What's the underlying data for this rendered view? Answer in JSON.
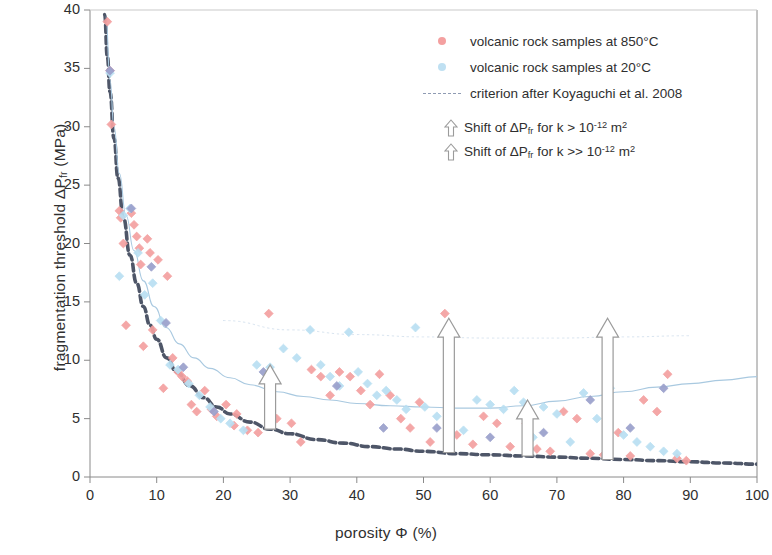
{
  "chart_data": {
    "type": "scatter",
    "title": "",
    "xlabel": "porosity Φ (%)",
    "ylabel": "fragmentation threshold ΔPfr  (MPa)",
    "xlim": [
      0,
      100
    ],
    "ylim": [
      0,
      40
    ],
    "xticks": [
      0,
      10,
      20,
      30,
      40,
      50,
      60,
      70,
      80,
      90,
      100
    ],
    "yticks": [
      0,
      5,
      10,
      15,
      20,
      25,
      30,
      35,
      40
    ],
    "grid": false,
    "legend_position": "top-right",
    "series": [
      {
        "name": "volcanic rock samples at 850°C",
        "type": "scatter",
        "color": "#f4a0a0",
        "marker": "diamond",
        "points": [
          [
            2.6,
            39.0
          ],
          [
            3.0,
            34.8
          ],
          [
            3.2,
            30.2
          ],
          [
            4.4,
            22.8
          ],
          [
            4.6,
            22.2
          ],
          [
            5.0,
            20.0
          ],
          [
            5.4,
            13.0
          ],
          [
            6.2,
            22.6
          ],
          [
            6.6,
            21.6
          ],
          [
            7.0,
            20.6
          ],
          [
            7.4,
            19.6
          ],
          [
            7.6,
            18.2
          ],
          [
            8.0,
            11.2
          ],
          [
            8.6,
            20.4
          ],
          [
            9.0,
            19.2
          ],
          [
            9.4,
            12.6
          ],
          [
            10.2,
            18.6
          ],
          [
            11.0,
            7.6
          ],
          [
            11.6,
            17.2
          ],
          [
            12.4,
            10.2
          ],
          [
            13.2,
            9.0
          ],
          [
            13.8,
            8.6
          ],
          [
            14.6,
            8.2
          ],
          [
            15.2,
            6.2
          ],
          [
            16.0,
            5.6
          ],
          [
            17.2,
            7.4
          ],
          [
            18.2,
            5.8
          ],
          [
            19.0,
            5.2
          ],
          [
            20.4,
            6.2
          ],
          [
            21.6,
            4.4
          ],
          [
            22.0,
            5.4
          ],
          [
            23.6,
            4.0
          ],
          [
            25.2,
            3.8
          ],
          [
            26.8,
            14.0
          ],
          [
            28.0,
            5.0
          ],
          [
            30.2,
            4.6
          ],
          [
            31.6,
            3.0
          ],
          [
            33.2,
            9.2
          ],
          [
            34.6,
            8.6
          ],
          [
            36.0,
            7.0
          ],
          [
            37.4,
            9.0
          ],
          [
            39.0,
            8.6
          ],
          [
            40.6,
            7.4
          ],
          [
            42.0,
            6.2
          ],
          [
            43.4,
            8.8
          ],
          [
            45.0,
            7.0
          ],
          [
            46.6,
            5.0
          ],
          [
            48.0,
            4.2
          ],
          [
            49.4,
            6.4
          ],
          [
            51.0,
            3.0
          ],
          [
            53.2,
            14.0
          ],
          [
            55.0,
            3.6
          ],
          [
            57.4,
            2.8
          ],
          [
            59.0,
            5.2
          ],
          [
            61.0,
            4.6
          ],
          [
            63.0,
            2.6
          ],
          [
            65.4,
            4.6
          ],
          [
            67.0,
            2.4
          ],
          [
            69.0,
            2.2
          ],
          [
            71.0,
            5.6
          ],
          [
            73.0,
            5.0
          ],
          [
            75.0,
            2.0
          ],
          [
            77.0,
            1.9
          ],
          [
            79.2,
            3.8
          ],
          [
            81.0,
            1.8
          ],
          [
            83.0,
            6.6
          ],
          [
            85.0,
            5.6
          ],
          [
            86.6,
            8.8
          ],
          [
            88.0,
            1.6
          ],
          [
            89.4,
            1.4
          ]
        ]
      },
      {
        "name": "volcanic rock samples at 20°C",
        "type": "scatter",
        "color": "#b9dff2",
        "marker": "diamond",
        "points": [
          [
            3.0,
            34.6
          ],
          [
            4.4,
            17.2
          ],
          [
            5.0,
            22.4
          ],
          [
            6.0,
            23.0
          ],
          [
            7.2,
            19.2
          ],
          [
            8.2,
            15.6
          ],
          [
            9.4,
            16.6
          ],
          [
            10.6,
            13.4
          ],
          [
            12.0,
            9.6
          ],
          [
            13.2,
            9.2
          ],
          [
            14.8,
            8.0
          ],
          [
            16.4,
            7.0
          ],
          [
            18.0,
            6.0
          ],
          [
            19.6,
            5.0
          ],
          [
            21.0,
            4.6
          ],
          [
            23.0,
            4.0
          ],
          [
            25.0,
            9.6
          ],
          [
            27.0,
            9.4
          ],
          [
            29.0,
            11.0
          ],
          [
            31.0,
            10.2
          ],
          [
            33.0,
            12.6
          ],
          [
            34.6,
            9.6
          ],
          [
            36.0,
            8.6
          ],
          [
            37.4,
            7.8
          ],
          [
            38.8,
            12.4
          ],
          [
            40.2,
            9.0
          ],
          [
            41.6,
            8.0
          ],
          [
            43.0,
            7.0
          ],
          [
            44.4,
            7.4
          ],
          [
            46.0,
            6.6
          ],
          [
            47.4,
            5.8
          ],
          [
            48.8,
            12.8
          ],
          [
            50.2,
            6.0
          ],
          [
            52.0,
            5.2
          ],
          [
            54.0,
            4.6
          ],
          [
            56.0,
            4.0
          ],
          [
            58.0,
            6.6
          ],
          [
            60.0,
            6.2
          ],
          [
            62.0,
            5.8
          ],
          [
            63.6,
            7.4
          ],
          [
            65.0,
            6.4
          ],
          [
            66.4,
            3.4
          ],
          [
            68.0,
            6.0
          ],
          [
            70.0,
            5.4
          ],
          [
            72.0,
            3.0
          ],
          [
            74.0,
            7.2
          ],
          [
            76.0,
            5.0
          ],
          [
            78.0,
            7.6
          ],
          [
            80.0,
            3.6
          ],
          [
            82.0,
            3.0
          ],
          [
            84.0,
            2.6
          ],
          [
            86.0,
            2.2
          ],
          [
            88.0,
            2.0
          ]
        ]
      },
      {
        "name": "volcanic rock samples (overlapping)",
        "type": "scatter",
        "color": "#9aa0cc",
        "marker": "diamond",
        "points": [
          [
            3.0,
            34.8
          ],
          [
            6.2,
            23.0
          ],
          [
            9.2,
            18.0
          ],
          [
            11.4,
            13.2
          ],
          [
            14.0,
            9.4
          ],
          [
            18.6,
            5.6
          ],
          [
            26.0,
            9.0
          ],
          [
            37.0,
            7.8
          ],
          [
            44.0,
            4.2
          ],
          [
            52.0,
            4.2
          ],
          [
            60.0,
            3.4
          ],
          [
            68.0,
            3.8
          ],
          [
            75.0,
            6.6
          ],
          [
            81.0,
            4.2
          ],
          [
            86.0,
            7.6
          ]
        ]
      }
    ],
    "curves": [
      {
        "name": "criterion after Koyaguchi et al. 2008",
        "style": "dashed",
        "color": "#4e5668",
        "width": 3.6,
        "points": [
          [
            2.2,
            39.6
          ],
          [
            2.6,
            36.0
          ],
          [
            3.0,
            33.0
          ],
          [
            3.6,
            29.0
          ],
          [
            4.2,
            25.6
          ],
          [
            5.0,
            22.2
          ],
          [
            6.0,
            19.0
          ],
          [
            7.0,
            16.6
          ],
          [
            8.0,
            14.6
          ],
          [
            9.0,
            13.0
          ],
          [
            10.0,
            11.8
          ],
          [
            11.5,
            10.2
          ],
          [
            13.0,
            9.0
          ],
          [
            15.0,
            7.8
          ],
          [
            17.0,
            6.8
          ],
          [
            19.0,
            6.0
          ],
          [
            21.0,
            5.4
          ],
          [
            24.0,
            4.7
          ],
          [
            27.0,
            4.1
          ],
          [
            30.0,
            3.7
          ],
          [
            34.0,
            3.2
          ],
          [
            38.0,
            2.9
          ],
          [
            42.0,
            2.6
          ],
          [
            46.0,
            2.4
          ],
          [
            50.0,
            2.2
          ],
          [
            55.0,
            2.0
          ],
          [
            60.0,
            1.9
          ],
          [
            65.0,
            1.8
          ],
          [
            70.0,
            1.7
          ],
          [
            75.0,
            1.6
          ],
          [
            80.0,
            1.5
          ],
          [
            85.0,
            1.4
          ],
          [
            90.0,
            1.3
          ],
          [
            95.0,
            1.2
          ],
          [
            100.0,
            1.1
          ]
        ]
      },
      {
        "name": "upper trend curve",
        "style": "solid-thin",
        "color": "#a9c9e0",
        "width": 1.1,
        "points": [
          [
            2.4,
            39.4
          ],
          [
            3.0,
            34.0
          ],
          [
            3.6,
            30.0
          ],
          [
            4.4,
            26.0
          ],
          [
            5.4,
            22.4
          ],
          [
            6.6,
            19.4
          ],
          [
            8.0,
            16.8
          ],
          [
            9.6,
            14.6
          ],
          [
            11.4,
            12.8
          ],
          [
            13.4,
            11.4
          ],
          [
            15.6,
            10.2
          ],
          [
            18.0,
            9.3
          ],
          [
            21.0,
            8.5
          ],
          [
            24.0,
            7.9
          ],
          [
            28.0,
            7.3
          ],
          [
            32.0,
            6.9
          ],
          [
            36.0,
            6.6
          ],
          [
            40.0,
            6.3
          ],
          [
            45.0,
            6.1
          ],
          [
            50.0,
            6.0
          ],
          [
            55.0,
            5.9
          ],
          [
            60.0,
            5.9
          ],
          [
            65.0,
            6.1
          ],
          [
            70.0,
            6.5
          ],
          [
            75.0,
            6.9
          ],
          [
            80.0,
            7.3
          ],
          [
            85.0,
            7.7
          ],
          [
            90.0,
            8.0
          ],
          [
            95.0,
            8.3
          ],
          [
            100.0,
            8.6
          ]
        ]
      },
      {
        "name": "upper dotted asymptote",
        "style": "dotted",
        "color": "#d8e4f0",
        "width": 1.0,
        "points": [
          [
            20.0,
            13.4
          ],
          [
            30.0,
            12.6
          ],
          [
            40.0,
            12.2
          ],
          [
            50.0,
            12.0
          ],
          [
            60.0,
            11.9
          ],
          [
            70.0,
            11.9
          ],
          [
            80.0,
            12.0
          ],
          [
            90.0,
            12.1
          ]
        ]
      }
    ],
    "arrows": [
      {
        "name": "shift-arrow-short-1",
        "x": 27.0,
        "y_start": 4.1,
        "y_end": 9.6,
        "kind": "k > 10^-12"
      },
      {
        "name": "shift-arrow-long-1",
        "x": 53.8,
        "y_start": 2.1,
        "y_end": 13.6,
        "kind": "k >> 10^-12"
      },
      {
        "name": "shift-arrow-short-2",
        "x": 65.6,
        "y_start": 1.8,
        "y_end": 6.6,
        "kind": "k > 10^-12"
      },
      {
        "name": "shift-arrow-long-2",
        "x": 77.6,
        "y_start": 1.5,
        "y_end": 13.6,
        "kind": "k >> 10^-12"
      }
    ]
  },
  "axes": {
    "x_title_prefix": "porosity ",
    "x_title_symbol": "Φ",
    "x_title_suffix": " (%)",
    "y_title_prefix": "fragmentation threshold ",
    "y_title_symbol": "ΔP",
    "y_title_sub": "fr",
    "y_title_suffix": " (MPa)"
  },
  "legend": {
    "items": [
      {
        "key": "dot",
        "color": "#f4a0a0",
        "label": "volcanic rock samples at 850°C"
      },
      {
        "key": "dot",
        "color": "#bfe0f2",
        "label": "volcanic rock samples at 20°C"
      },
      {
        "key": "dash",
        "color": "#8f9bb3",
        "label": "criterion after Koyaguchi et al. 2008"
      }
    ],
    "arrow_items": [
      {
        "prefix": "Shift of ",
        "symbol": "ΔP",
        "sub": "fr",
        "middle": "  for k > 10",
        "exponent": "-12",
        "suffix": " m",
        "unit_exponent": "2"
      },
      {
        "prefix": "Shift of ",
        "symbol": "ΔP",
        "sub": "fr",
        "middle": "  for k >> 10",
        "exponent": "-12",
        "suffix": " m",
        "unit_exponent": "2"
      }
    ]
  },
  "colors": {
    "hot_samples": "#f4a0a0",
    "cold_samples": "#bfe0f2",
    "overlap_samples": "#9aa0cc",
    "criterion_curve": "#4e5668",
    "trend_curve": "#a9c9e0",
    "axis": "#8a8a8a",
    "text": "#2f2f2f",
    "background": "#ffffff"
  }
}
